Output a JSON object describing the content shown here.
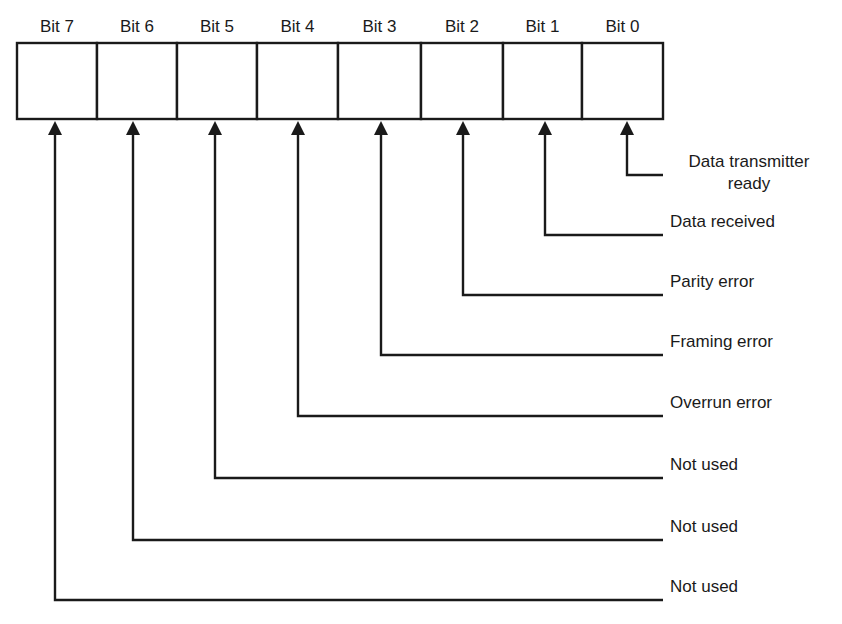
{
  "diagram": {
    "title": "",
    "register_bits": [
      {
        "bit": 7,
        "label": "Bit 7",
        "description": [
          "Not used"
        ]
      },
      {
        "bit": 6,
        "label": "Bit 6",
        "description": [
          "Not used"
        ]
      },
      {
        "bit": 5,
        "label": "Bit 5",
        "description": [
          "Not used"
        ]
      },
      {
        "bit": 4,
        "label": "Bit 4",
        "description": [
          "Overrun error"
        ]
      },
      {
        "bit": 3,
        "label": "Bit 3",
        "description": [
          "Framing error"
        ]
      },
      {
        "bit": 2,
        "label": "Bit 2",
        "description": [
          "Parity error"
        ]
      },
      {
        "bit": 1,
        "label": "Bit 1",
        "description": [
          "Data received"
        ]
      },
      {
        "bit": 0,
        "label": "Bit 0",
        "description": [
          "Data transmitter",
          "ready"
        ]
      }
    ],
    "colors": {
      "ink": "#1a1a1a",
      "background": "#ffffff"
    }
  }
}
